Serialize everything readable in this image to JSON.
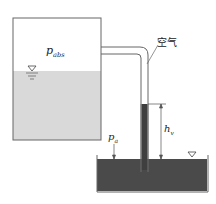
{
  "diagram": {
    "labels": {
      "p_abs": {
        "base": "p",
        "sub": "abs"
      },
      "air": "空气",
      "p_a": {
        "base": "p",
        "sub": "a"
      },
      "h_v": {
        "base": "h",
        "sub": "v"
      }
    },
    "colors": {
      "stroke": "#555555",
      "left_water": "#d9d9d9",
      "right_liquid": "#4a4a4a",
      "column": "#3f3f3f"
    }
  }
}
